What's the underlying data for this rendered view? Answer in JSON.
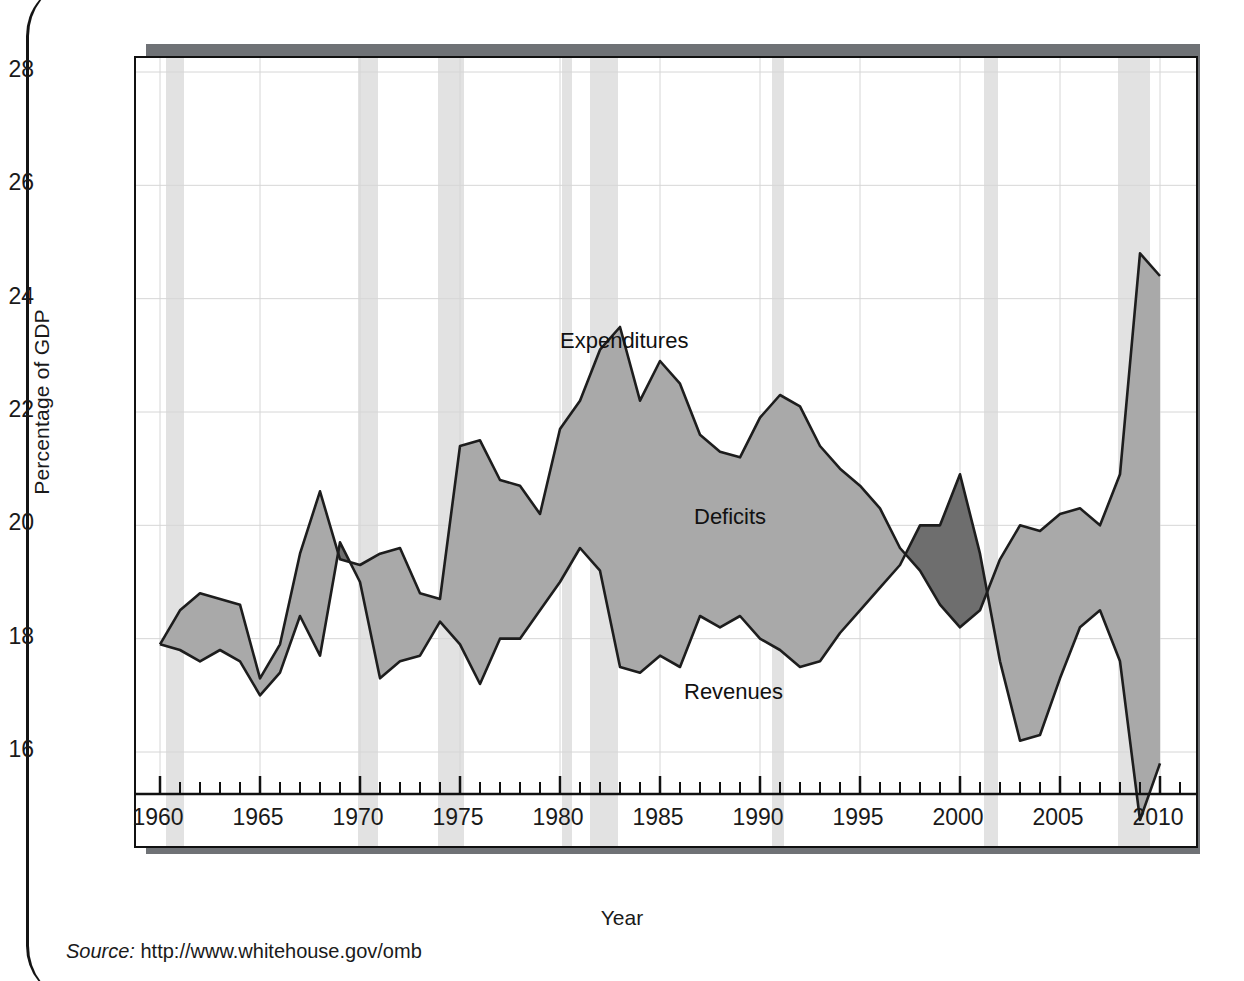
{
  "figure": {
    "source_prefix": "Source:",
    "source_url": "http://www.whitehouse.gov/omb"
  },
  "chart_data": {
    "type": "area",
    "title": "",
    "xlabel": "Year",
    "ylabel": "Percentage of GDP",
    "xlim": [
      1960,
      2010
    ],
    "ylim": [
      14.6,
      28.3
    ],
    "yticks": [
      16,
      18,
      20,
      22,
      24,
      26,
      28
    ],
    "xticks": [
      1960,
      1965,
      1970,
      1975,
      1980,
      1985,
      1990,
      1995,
      2000,
      2005,
      2010
    ],
    "xtick_step_minor": 1,
    "grid": "both",
    "legend": "inline-annotations",
    "annotations": [
      {
        "text": "Expenditures",
        "x": 1983.6,
        "y": 23.2
      },
      {
        "text": "Deficits",
        "x": 1990.3,
        "y": 20.1
      },
      {
        "text": "Revenues",
        "x": 1989.8,
        "y": 17.0
      }
    ],
    "colors": {
      "deficit_fill": "#a9a9a9",
      "surplus_fill": "#6e6e6e",
      "line": "#1d1d1d",
      "recession_band": "#e2e2e2",
      "grid": "#d6d6d6",
      "frame": "#111111",
      "shadow": "#6f7276"
    },
    "x": [
      1960,
      1961,
      1962,
      1963,
      1964,
      1965,
      1966,
      1967,
      1968,
      1969,
      1970,
      1971,
      1972,
      1973,
      1974,
      1975,
      1976,
      1977,
      1978,
      1979,
      1980,
      1981,
      1982,
      1983,
      1984,
      1985,
      1986,
      1987,
      1988,
      1989,
      1990,
      1991,
      1992,
      1993,
      1994,
      1995,
      1996,
      1997,
      1998,
      1999,
      2000,
      2001,
      2002,
      2003,
      2004,
      2005,
      2006,
      2007,
      2008,
      2009,
      2010
    ],
    "series": [
      {
        "name": "Expenditures",
        "values": [
          17.9,
          18.5,
          18.8,
          18.7,
          18.6,
          17.3,
          17.9,
          19.5,
          20.6,
          19.4,
          19.3,
          19.5,
          19.6,
          18.8,
          18.7,
          21.4,
          21.5,
          20.8,
          20.7,
          20.2,
          21.7,
          22.2,
          23.1,
          23.5,
          22.2,
          22.9,
          22.5,
          21.6,
          21.3,
          21.2,
          21.9,
          22.3,
          22.1,
          21.4,
          21.0,
          20.7,
          20.3,
          19.6,
          19.2,
          18.6,
          18.2,
          18.5,
          19.4,
          20.0,
          19.9,
          20.2,
          20.3,
          20.0,
          20.9,
          24.8,
          24.4
        ]
      },
      {
        "name": "Revenues",
        "values": [
          17.9,
          17.8,
          17.6,
          17.8,
          17.6,
          17.0,
          17.4,
          18.4,
          17.7,
          19.7,
          19.0,
          17.3,
          17.6,
          17.7,
          18.3,
          17.9,
          17.2,
          18.0,
          18.0,
          18.5,
          19.0,
          19.6,
          19.2,
          17.5,
          17.4,
          17.7,
          17.5,
          18.4,
          18.2,
          18.4,
          18.0,
          17.8,
          17.5,
          17.6,
          18.1,
          18.5,
          18.9,
          19.3,
          20.0,
          20.0,
          20.9,
          19.5,
          17.6,
          16.2,
          16.3,
          17.3,
          18.2,
          18.5,
          17.6,
          14.8,
          15.8
        ]
      }
    ],
    "recessions": [
      {
        "start": 1960.3,
        "end": 1961.2
      },
      {
        "start": 1969.9,
        "end": 1970.9
      },
      {
        "start": 1973.9,
        "end": 1975.2
      },
      {
        "start": 1980.1,
        "end": 1980.6
      },
      {
        "start": 1981.5,
        "end": 1982.9
      },
      {
        "start": 1990.6,
        "end": 1991.2
      },
      {
        "start": 2001.2,
        "end": 2001.9
      },
      {
        "start": 2007.9,
        "end": 2009.5
      }
    ],
    "surplus_years": [
      1998,
      1999,
      2000,
      2001
    ]
  }
}
